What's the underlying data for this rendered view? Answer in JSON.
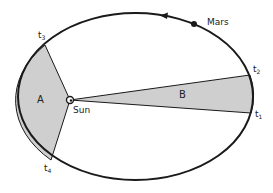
{
  "diagram": {
    "orbit": {
      "cx": 135.5,
      "cy": 96.5,
      "rx": 117.5,
      "ry": 83.5
    },
    "colors": {
      "stroke": "#1a1a1a",
      "sector_fill": "#cfcfcf",
      "background": "#ffffff"
    },
    "sun": {
      "label": "Sun",
      "x": 70,
      "y": 100
    },
    "planet": {
      "label": "Mars",
      "x": 194,
      "y": 24
    },
    "direction_arrow": {
      "x": 165,
      "y": 16,
      "direction": "counterclockwise"
    },
    "sectors": [
      {
        "label": "A",
        "from": "t3",
        "to": "t4"
      },
      {
        "label": "B",
        "from": "t1",
        "to": "t2"
      }
    ],
    "time_points": [
      {
        "id": "t1",
        "base": "t",
        "sub": "1",
        "x": 251,
        "y": 113
      },
      {
        "id": "t2",
        "base": "t",
        "sub": "2",
        "x": 250,
        "y": 75
      },
      {
        "id": "t3",
        "base": "t",
        "sub": "3",
        "x": 45,
        "y": 45
      },
      {
        "id": "t4",
        "base": "t",
        "sub": "4",
        "x": 51,
        "y": 160
      }
    ]
  }
}
